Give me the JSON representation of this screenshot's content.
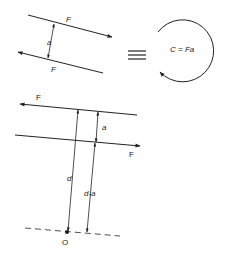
{
  "diagram": {
    "top_left": {
      "force_top_label": "F",
      "force_bottom_label": "F",
      "separation_label": "a"
    },
    "equivalence_symbol": "≡",
    "couple": {
      "label": "C = Fa"
    },
    "bottom": {
      "force_top_label": "F",
      "force_bottom_label": "F",
      "separation_label": "a",
      "distance_d_label": "d",
      "distance_d_minus_a_label": "d-a",
      "origin_label": "O"
    },
    "colors": {
      "line": "#222222",
      "background": "#ffffff"
    }
  }
}
